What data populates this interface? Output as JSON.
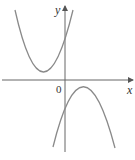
{
  "figure": {
    "type": "function graph",
    "axes": {
      "x_label": "x",
      "y_label": "y",
      "origin_label": "0"
    },
    "curves": [
      {
        "name": "upper-parabola",
        "shape": "concave up, vertex left of y-axis, above x-axis"
      },
      {
        "name": "lower-parabola",
        "shape": "concave down, vertex right of y-axis, below x-axis"
      }
    ],
    "colors": {
      "curve": "#8a8a8a",
      "axis": "#666666",
      "text": "#333333"
    }
  }
}
